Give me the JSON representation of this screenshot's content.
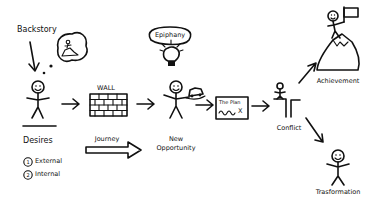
{
  "diagram": {
    "type": "story-arc-flow",
    "stages": [
      {
        "id": "backstory",
        "label": "Backstory"
      },
      {
        "id": "desires",
        "label": "Desires",
        "sub_items": [
          "External",
          "Internal"
        ],
        "sub_numbers": [
          "1",
          "2"
        ]
      },
      {
        "id": "wall",
        "label": "WALL"
      },
      {
        "id": "journey",
        "label": "Journey"
      },
      {
        "id": "epiphany",
        "label": "Epiphany"
      },
      {
        "id": "new_opportunity",
        "label_line1": "New",
        "label_line2": "Opportunity"
      },
      {
        "id": "plan",
        "label": "The Plan",
        "mark": "X"
      },
      {
        "id": "conflict",
        "label": "Conflict"
      },
      {
        "id": "achievement",
        "label": "Achievement"
      },
      {
        "id": "transformation",
        "label": "Trasformation"
      }
    ],
    "edges": [
      {
        "from": "backstory",
        "to": "desires"
      },
      {
        "from": "desires",
        "to": "wall"
      },
      {
        "from": "wall",
        "to": "new_opportunity"
      },
      {
        "from": "epiphany",
        "to": "new_opportunity"
      },
      {
        "from": "new_opportunity",
        "to": "plan"
      },
      {
        "from": "plan",
        "to": "conflict"
      },
      {
        "from": "conflict",
        "to": "achievement"
      },
      {
        "from": "conflict",
        "to": "transformation"
      }
    ],
    "colors": {
      "ink": "#111111",
      "background": "#ffffff"
    }
  }
}
